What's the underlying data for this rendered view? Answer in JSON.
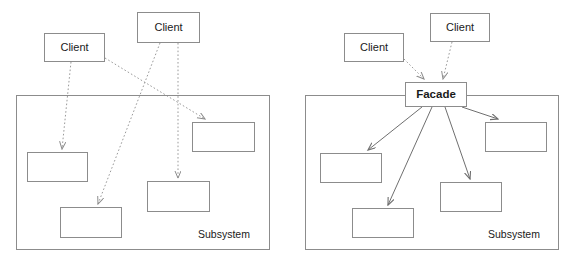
{
  "diagram": {
    "stroke_color": "#8c8c8c",
    "text_color": "#1a1a1a",
    "background": "#ffffff",
    "panels": [
      {
        "id": "without-facade",
        "name": "Without Facade",
        "container": {
          "label": "Subsystem",
          "x": 16,
          "y": 95,
          "w": 254,
          "h": 155,
          "label_x": 198,
          "label_y": 228
        },
        "clients": [
          {
            "label": "Client",
            "x": 44,
            "y": 33,
            "w": 61,
            "h": 29
          },
          {
            "label": "Client",
            "x": 137,
            "y": 12,
            "w": 63,
            "h": 31
          }
        ],
        "components": [
          {
            "label": "",
            "x": 27,
            "y": 152,
            "w": 61,
            "h": 30
          },
          {
            "label": "",
            "x": 60,
            "y": 207,
            "w": 62,
            "h": 31
          },
          {
            "label": "",
            "x": 147,
            "y": 181,
            "w": 63,
            "h": 31
          },
          {
            "label": "",
            "x": 192,
            "y": 122,
            "w": 63,
            "h": 30
          }
        ],
        "edges": [
          {
            "from": "client-left",
            "to": "component-1",
            "x1": 71,
            "y1": 62,
            "x2": 62,
            "y2": 149,
            "style": "dotted"
          },
          {
            "from": "client-left",
            "to": "component-4",
            "x1": 105,
            "y1": 58,
            "x2": 205,
            "y2": 119,
            "style": "dotted"
          },
          {
            "from": "client-top",
            "to": "component-2",
            "x1": 160,
            "y1": 43,
            "x2": 98,
            "y2": 204,
            "style": "dotted"
          },
          {
            "from": "client-top",
            "to": "component-3",
            "x1": 178,
            "y1": 43,
            "x2": 178,
            "y2": 178,
            "style": "dotted"
          }
        ]
      },
      {
        "id": "with-facade",
        "name": "With Facade",
        "container": {
          "label": "Subsystem",
          "x": 305,
          "y": 95,
          "w": 254,
          "h": 155,
          "label_x": 488,
          "label_y": 228
        },
        "clients": [
          {
            "label": "Client",
            "x": 344,
            "y": 33,
            "w": 60,
            "h": 29
          },
          {
            "label": "Client",
            "x": 430,
            "y": 13,
            "w": 60,
            "h": 29
          }
        ],
        "facade": {
          "label": "Facade",
          "x": 405,
          "y": 82,
          "w": 62,
          "h": 25
        },
        "components": [
          {
            "label": "",
            "x": 320,
            "y": 153,
            "w": 62,
            "h": 30
          },
          {
            "label": "",
            "x": 352,
            "y": 208,
            "w": 62,
            "h": 30
          },
          {
            "label": "",
            "x": 440,
            "y": 182,
            "w": 62,
            "h": 30
          },
          {
            "label": "",
            "x": 485,
            "y": 122,
            "w": 62,
            "h": 30
          }
        ],
        "edges": [
          {
            "from": "client-left",
            "to": "facade",
            "x1": 404,
            "y1": 59,
            "x2": 424,
            "y2": 79,
            "style": "dotted"
          },
          {
            "from": "client-top",
            "to": "facade",
            "x1": 452,
            "y1": 42,
            "x2": 443,
            "y2": 79,
            "style": "dotted"
          },
          {
            "from": "facade",
            "to": "component-1",
            "x1": 422,
            "y1": 107,
            "x2": 368,
            "y2": 150,
            "style": "solid"
          },
          {
            "from": "facade",
            "to": "component-2",
            "x1": 432,
            "y1": 107,
            "x2": 388,
            "y2": 205,
            "style": "solid"
          },
          {
            "from": "facade",
            "to": "component-3",
            "x1": 445,
            "y1": 107,
            "x2": 470,
            "y2": 179,
            "style": "solid"
          },
          {
            "from": "facade",
            "to": "component-4",
            "x1": 462,
            "y1": 107,
            "x2": 498,
            "y2": 119,
            "style": "solid"
          }
        ]
      }
    ]
  }
}
